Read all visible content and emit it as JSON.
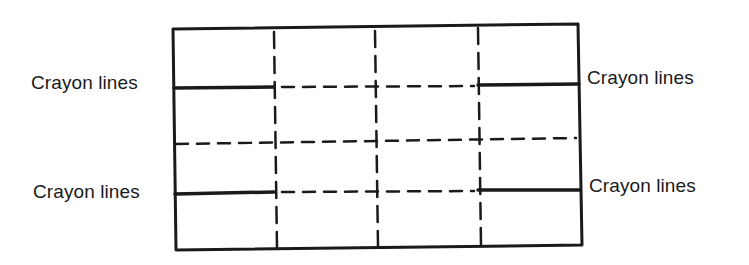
{
  "diagram": {
    "type": "panel-grid-with-crayon-guides",
    "colors": {
      "ink": "#1a1a1a",
      "background": "#ffffff"
    },
    "labels": {
      "upper_left": "Crayon lines",
      "upper_right": "Crayon lines",
      "lower_left": "Crayon lines",
      "lower_right": "Crayon lines"
    },
    "grid": {
      "outer_box": true,
      "vertical_dashed_lines": 3,
      "horizontal_dashed_lines": 3,
      "crayon_line_rows": [
        "upper",
        "lower"
      ],
      "crayon_segments_per_row": [
        "left-edge to first vertical",
        "third vertical to right-edge"
      ]
    }
  }
}
